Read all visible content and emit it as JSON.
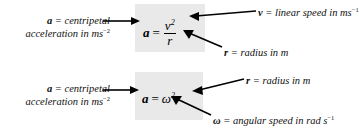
{
  "figure": {
    "type": "annotated-formula-diagram",
    "background_color": "#ffffff",
    "box_color": "#e9e9e9",
    "diagrams": [
      {
        "id": "centripetal-acceleration-linear-speed",
        "formula": {
          "lhs": "a",
          "equals": "=",
          "numerator": "v",
          "numerator_exponent": "2",
          "denominator": "r"
        },
        "labels": {
          "left": {
            "symbol": "a",
            "line1": "= centripetal",
            "line2": "acceleration in ms",
            "line2_exponent": "−2",
            "full_text": "a = centripetal acceleration in ms−2"
          },
          "top_right": {
            "symbol": "v",
            "text": "= linear speed in ms",
            "exponent": "−1",
            "full_text": "v = linear speed in ms−1"
          },
          "bottom_right": {
            "symbol": "r",
            "text": "= radius in m",
            "exponent": "",
            "full_text": "r = radius in m"
          }
        }
      },
      {
        "id": "centripetal-acceleration-angular-speed",
        "formula": {
          "lhs": "a",
          "equals": "=",
          "base": "ω",
          "exponent": "2",
          "factor": "r"
        },
        "labels": {
          "left": {
            "symbol": "a",
            "line1": "= centripetal",
            "line2": "acceleration in ms",
            "line2_exponent": "−2",
            "full_text": "a = centripetal acceleration in ms−2"
          },
          "top_right": {
            "symbol": "r",
            "text": "= radius in m",
            "exponent": "",
            "full_text": "r = radius in m"
          },
          "bottom_right": {
            "symbol": "ω",
            "text": "= angular speed in rad s",
            "exponent": "−1",
            "full_text": "ω = angular speed in rad s−1"
          }
        }
      }
    ]
  }
}
